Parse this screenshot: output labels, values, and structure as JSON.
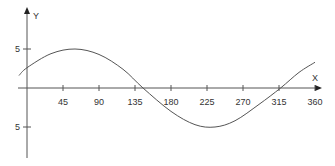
{
  "chart_data": {
    "type": "line",
    "title": "",
    "xlabel": "X",
    "ylabel": "Y",
    "x_ticks": [
      45,
      90,
      135,
      180,
      225,
      270,
      315,
      360
    ],
    "x_tick_labels": [
      "45",
      "90",
      "135",
      "180",
      "225",
      "270",
      "315",
      "360"
    ],
    "y_ticks": [
      5,
      -5
    ],
    "y_tick_labels": [
      "5",
      "5"
    ],
    "xlim": [
      -10,
      360
    ],
    "ylim": [
      -9,
      10
    ],
    "grid": false,
    "series": [
      {
        "name": "wave",
        "color": "#555555",
        "x": [
          -10,
          0,
          30,
          60,
          90,
          120,
          145,
          180,
          210,
          235,
          260,
          290,
          317,
          340,
          360
        ],
        "y": [
          1.6,
          2.6,
          4.4,
          5.0,
          4.3,
          2.4,
          0.0,
          -3.0,
          -4.7,
          -5.0,
          -4.2,
          -2.1,
          0.0,
          2.0,
          3.3
        ]
      }
    ]
  }
}
